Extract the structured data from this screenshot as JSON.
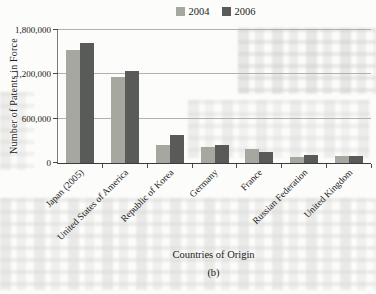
{
  "chart_data": {
    "type": "bar",
    "title": "",
    "categories": [
      "Japan (2005)",
      "United States of America",
      "Republic of Korea",
      "Germany",
      "France",
      "Russian Federation",
      "United Kingdom"
    ],
    "series": [
      {
        "name": "2004",
        "color": "#a6a8a0",
        "values": [
          1530000,
          1160000,
          250000,
          215000,
          195000,
          75000,
          90000
        ]
      },
      {
        "name": "2006",
        "color": "#595b59",
        "values": [
          1620000,
          1250000,
          375000,
          250000,
          150000,
          110000,
          95000
        ]
      }
    ],
    "xlabel": "Countries of Origin",
    "ylabel": "Number of Patents in Force",
    "ylim": [
      0,
      1800000
    ],
    "yticks": [
      {
        "value": 0,
        "label": "0"
      },
      {
        "value": 600000,
        "label": "600,000"
      },
      {
        "value": 1200000,
        "label": "1,200,000"
      },
      {
        "value": 1800000,
        "label": "1,800,000"
      }
    ],
    "legend_position": "top",
    "grid": "horizontal",
    "caption": "(b)"
  }
}
